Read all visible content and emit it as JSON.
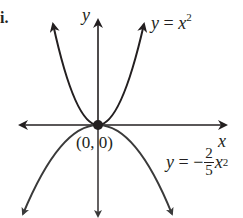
{
  "figure": {
    "part_label": "i.",
    "axes": {
      "x_label": "x",
      "y_label": "y",
      "origin_label": "(0, 0)"
    },
    "curves": [
      {
        "name": "upper-parabola",
        "equation_lhs": "y",
        "equation_eq": " = ",
        "equation_rhs": "x",
        "exponent": "2",
        "opens": "up"
      },
      {
        "name": "lower-parabola",
        "equation_lhs": "y",
        "equation_eq": " = −",
        "coefficient_numerator": "2",
        "coefficient_denominator": "5",
        "equation_rhs": "x",
        "exponent": "2",
        "opens": "down"
      }
    ],
    "colors": {
      "ink": "#231f20",
      "lower_curve": "#3a3a3a",
      "background": "#ffffff"
    }
  }
}
